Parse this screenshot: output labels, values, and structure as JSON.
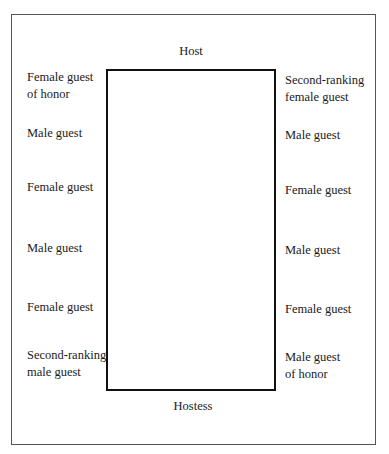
{
  "diagram": {
    "top_label": "Host",
    "bottom_label": "Hostess",
    "left_seats": [
      "Female guest\nof honor",
      "Male guest",
      "Female guest",
      "Male guest",
      "Female guest",
      "Second-ranking\nmale guest"
    ],
    "right_seats": [
      "Second-ranking\nfemale guest",
      "Male guest",
      "Female guest",
      "Male guest",
      "Female guest",
      "Male guest\nof honor"
    ]
  }
}
